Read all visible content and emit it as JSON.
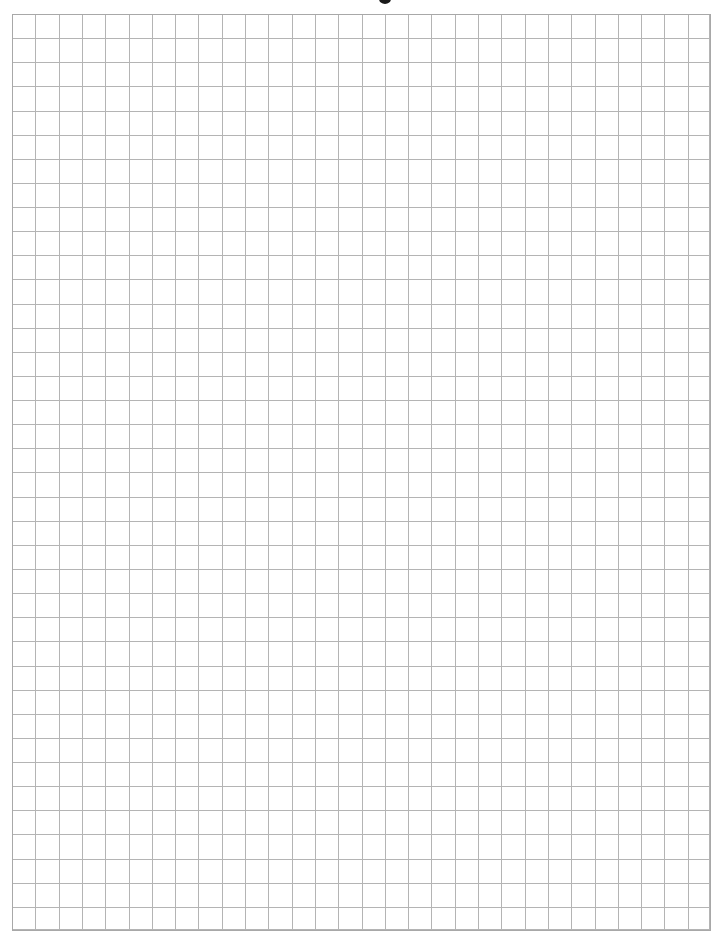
{
  "page": {
    "type": "graph-paper",
    "background_color": "#ffffff"
  },
  "grid": {
    "columns": 30,
    "rows": 38,
    "line_color": "#b4b4b4",
    "border_color": "#a8a8a8",
    "origin_px": [
      12,
      14
    ],
    "size_px": [
      699,
      917
    ],
    "cell_width_px": 23.3,
    "cell_height_px": 24.13
  },
  "header": {
    "clipped_title_mark": "",
    "mark_color": "#1a1a1a"
  }
}
